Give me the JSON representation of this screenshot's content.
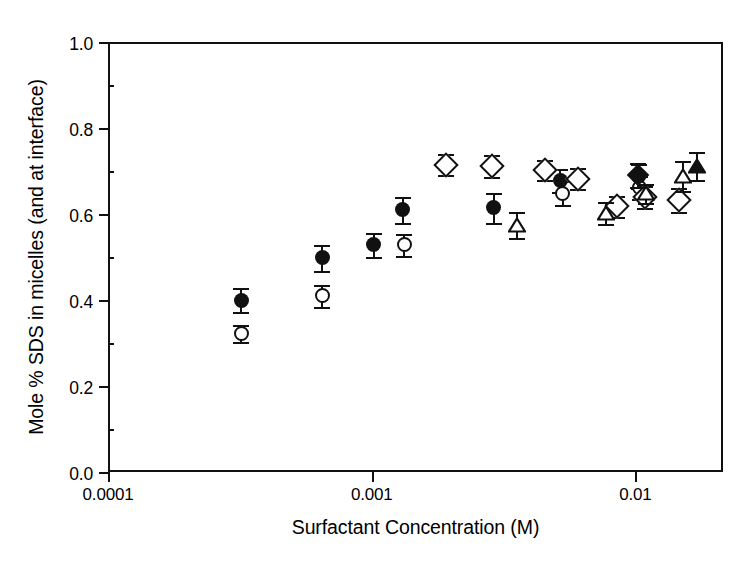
{
  "chart_data": {
    "type": "scatter",
    "title": "",
    "xlabel": "Surfactant Concentration (M)",
    "ylabel": "Mole % SDS in micelles (and at interface)",
    "xscale": "log",
    "xlim": [
      0.0001,
      0.0215
    ],
    "ylim": [
      0.0,
      1.0
    ],
    "grid": false,
    "legend": "none",
    "xticks": [
      {
        "value": 0.0001,
        "label": "0.0001"
      },
      {
        "value": 0.001,
        "label": "0.001"
      },
      {
        "value": 0.01,
        "label": "0.01"
      }
    ],
    "yticks": [
      {
        "value": 0.0,
        "label": "0.0"
      },
      {
        "value": 0.2,
        "label": "0.2"
      },
      {
        "value": 0.4,
        "label": "0.4"
      },
      {
        "value": 0.6,
        "label": "0.6"
      },
      {
        "value": 0.8,
        "label": "0.8"
      },
      {
        "value": 1.0,
        "label": "1.0"
      }
    ],
    "series": [
      {
        "name": "filled-circle",
        "marker": "circle-filled",
        "points": [
          {
            "x": 0.00032,
            "y": 0.4,
            "yerr": 0.028
          },
          {
            "x": 0.00065,
            "y": 0.498,
            "yerr": 0.03
          },
          {
            "x": 0.00102,
            "y": 0.528,
            "yerr": 0.028
          },
          {
            "x": 0.00131,
            "y": 0.61,
            "yerr": 0.03
          },
          {
            "x": 0.0029,
            "y": 0.615,
            "yerr": 0.035
          },
          {
            "x": 0.0052,
            "y": 0.678,
            "yerr": 0.026
          },
          {
            "x": 0.0103,
            "y": 0.688,
            "yerr": 0.028
          }
        ]
      },
      {
        "name": "open-circle",
        "marker": "circle-open",
        "points": [
          {
            "x": 0.00032,
            "y": 0.322,
            "yerr": 0.02
          },
          {
            "x": 0.00065,
            "y": 0.41,
            "yerr": 0.026
          },
          {
            "x": 0.00133,
            "y": 0.528,
            "yerr": 0.026
          },
          {
            "x": 0.0053,
            "y": 0.648,
            "yerr": 0.028
          },
          {
            "x": 0.0104,
            "y": 0.662,
            "yerr": 0.026
          }
        ]
      },
      {
        "name": "open-diamond",
        "marker": "diamond-open",
        "points": [
          {
            "x": 0.00191,
            "y": 0.715,
            "yerr": 0.025
          },
          {
            "x": 0.00286,
            "y": 0.712,
            "yerr": 0.025
          },
          {
            "x": 0.00455,
            "y": 0.702,
            "yerr": 0.024
          },
          {
            "x": 0.00605,
            "y": 0.682,
            "yerr": 0.025
          },
          {
            "x": 0.00855,
            "y": 0.618,
            "yerr": 0.025
          },
          {
            "x": 0.0109,
            "y": 0.64,
            "yerr": 0.025
          },
          {
            "x": 0.0147,
            "y": 0.632,
            "yerr": 0.028
          }
        ]
      },
      {
        "name": "open-triangle",
        "marker": "triangle-open",
        "points": [
          {
            "x": 0.00355,
            "y": 0.575,
            "yerr": 0.03
          },
          {
            "x": 0.00775,
            "y": 0.602,
            "yerr": 0.026
          },
          {
            "x": 0.011,
            "y": 0.648,
            "yerr": 0.022
          },
          {
            "x": 0.0152,
            "y": 0.688,
            "yerr": 0.035
          }
        ]
      },
      {
        "name": "filled-triangle",
        "marker": "triangle-filled",
        "points": [
          {
            "x": 0.0172,
            "y": 0.712,
            "yerr": 0.032
          }
        ]
      },
      {
        "name": "filled-diamond",
        "marker": "diamond-filled",
        "points": [
          {
            "x": 0.0102,
            "y": 0.69,
            "yerr": 0.028
          }
        ]
      }
    ]
  }
}
